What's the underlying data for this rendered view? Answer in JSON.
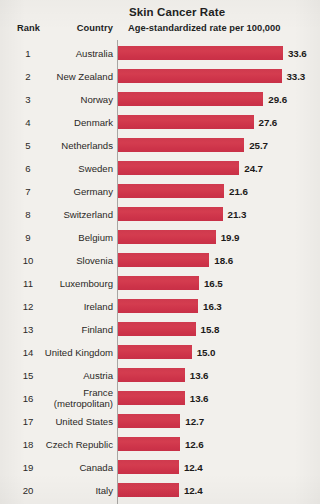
{
  "header": {
    "title": "Skin Cancer Rate",
    "subtitle": "Age-standardized rate per 100,000",
    "col_rank": "Rank",
    "col_country": "Country"
  },
  "colors": {
    "bar": "#d2384c",
    "background": "#f2f0ec",
    "axis": "#a8a6a3",
    "text": "#221f1f"
  },
  "chart_data": {
    "type": "bar",
    "orientation": "horizontal",
    "title": "Skin Cancer Rate",
    "subtitle": "Age-standardized rate per 100,000",
    "xlabel": "Age-standardized rate per 100,000",
    "ylabel": "Country",
    "xlim": [
      0,
      33.6
    ],
    "grid": false,
    "legend": false,
    "categories": [
      "Australia",
      "New Zealand",
      "Norway",
      "Denmark",
      "Netherlands",
      "Sweden",
      "Germany",
      "Switzerland",
      "Belgium",
      "Slovenia",
      "Luxembourg",
      "Ireland",
      "Finland",
      "United Kingdom",
      "Austria",
      "France (metropolitan)",
      "United States",
      "Czech Republic",
      "Canada",
      "Italy"
    ],
    "values": [
      33.6,
      33.3,
      29.6,
      27.6,
      25.7,
      24.7,
      21.6,
      21.3,
      19.9,
      18.6,
      16.5,
      16.3,
      15.8,
      15.0,
      13.6,
      13.6,
      12.7,
      12.6,
      12.4,
      12.4
    ],
    "rows": [
      {
        "rank": "1",
        "country": "Australia",
        "country_line2": "",
        "value": 33.6,
        "label": "33.6"
      },
      {
        "rank": "2",
        "country": "New Zealand",
        "country_line2": "",
        "value": 33.3,
        "label": "33.3"
      },
      {
        "rank": "3",
        "country": "Norway",
        "country_line2": "",
        "value": 29.6,
        "label": "29.6"
      },
      {
        "rank": "4",
        "country": "Denmark",
        "country_line2": "",
        "value": 27.6,
        "label": "27.6"
      },
      {
        "rank": "5",
        "country": "Netherlands",
        "country_line2": "",
        "value": 25.7,
        "label": "25.7"
      },
      {
        "rank": "6",
        "country": "Sweden",
        "country_line2": "",
        "value": 24.7,
        "label": "24.7"
      },
      {
        "rank": "7",
        "country": "Germany",
        "country_line2": "",
        "value": 21.6,
        "label": "21.6"
      },
      {
        "rank": "8",
        "country": "Switzerland",
        "country_line2": "",
        "value": 21.3,
        "label": "21.3"
      },
      {
        "rank": "9",
        "country": "Belgium",
        "country_line2": "",
        "value": 19.9,
        "label": "19.9"
      },
      {
        "rank": "10",
        "country": "Slovenia",
        "country_line2": "",
        "value": 18.6,
        "label": "18.6"
      },
      {
        "rank": "11",
        "country": "Luxembourg",
        "country_line2": "",
        "value": 16.5,
        "label": "16.5"
      },
      {
        "rank": "12",
        "country": "Ireland",
        "country_line2": "",
        "value": 16.3,
        "label": "16.3"
      },
      {
        "rank": "13",
        "country": "Finland",
        "country_line2": "",
        "value": 15.8,
        "label": "15.8"
      },
      {
        "rank": "14",
        "country": "United Kingdom",
        "country_line2": "",
        "value": 15.0,
        "label": "15.0"
      },
      {
        "rank": "15",
        "country": "Austria",
        "country_line2": "",
        "value": 13.6,
        "label": "13.6"
      },
      {
        "rank": "16",
        "country": "France",
        "country_line2": "(metropolitan)",
        "value": 13.6,
        "label": "13.6"
      },
      {
        "rank": "17",
        "country": "United States",
        "country_line2": "",
        "value": 12.7,
        "label": "12.7"
      },
      {
        "rank": "18",
        "country": "Czech Republic",
        "country_line2": "",
        "value": 12.6,
        "label": "12.6"
      },
      {
        "rank": "19",
        "country": "Canada",
        "country_line2": "",
        "value": 12.4,
        "label": "12.4"
      },
      {
        "rank": "20",
        "country": "Italy",
        "country_line2": "",
        "value": 12.4,
        "label": "12.4"
      }
    ]
  }
}
